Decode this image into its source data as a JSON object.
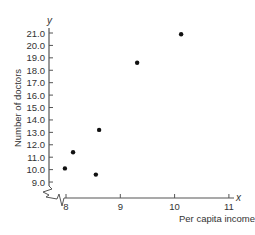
{
  "chart_data": {
    "type": "scatter",
    "title": "",
    "xlabel": "Per capita income",
    "ylabel": "Number of doctors",
    "x_axis_symbol": "x",
    "y_axis_symbol": "y",
    "xlim": [
      8,
      11
    ],
    "ylim": [
      9.0,
      21.0
    ],
    "x_ticks": [
      "8",
      "9",
      "10",
      "11"
    ],
    "y_ticks": [
      "9.0",
      "10.0",
      "11.0",
      "12.0",
      "13.0",
      "14.0",
      "15.0",
      "16.0",
      "17.0",
      "18.0",
      "19.0",
      "20.0",
      "21.0"
    ],
    "axis_break": true,
    "grid": false,
    "points": [
      {
        "x": 7.98,
        "y": 10.1
      },
      {
        "x": 8.13,
        "y": 11.4
      },
      {
        "x": 8.55,
        "y": 9.6
      },
      {
        "x": 8.61,
        "y": 13.2
      },
      {
        "x": 9.31,
        "y": 18.6
      },
      {
        "x": 10.12,
        "y": 20.9
      }
    ],
    "marker_color": "#111111",
    "axis_color": "#555555"
  }
}
